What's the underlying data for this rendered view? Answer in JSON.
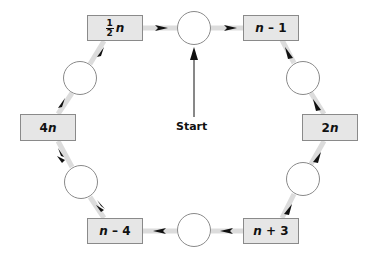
{
  "diagram": {
    "title": "",
    "start_label": "Start",
    "nodes": [
      {
        "id": "half_n",
        "type": "box",
        "label_fraction_num": "1",
        "label_fraction_den": "2",
        "label_var": "n"
      },
      {
        "id": "c_top",
        "type": "circle",
        "label": ""
      },
      {
        "id": "n_minus_1",
        "type": "box",
        "label": "n – 1"
      },
      {
        "id": "c_right_top",
        "type": "circle",
        "label": ""
      },
      {
        "id": "two_n",
        "type": "box",
        "label": "2n"
      },
      {
        "id": "c_right_bottom",
        "type": "circle",
        "label": ""
      },
      {
        "id": "n_plus_3",
        "type": "box",
        "label": "n + 3"
      },
      {
        "id": "c_bottom",
        "type": "circle",
        "label": ""
      },
      {
        "id": "n_minus_4",
        "type": "box",
        "label": "n – 4"
      },
      {
        "id": "c_left_bottom",
        "type": "circle",
        "label": ""
      },
      {
        "id": "four_n",
        "type": "box",
        "label": "4n"
      },
      {
        "id": "c_left_top",
        "type": "circle",
        "label": ""
      }
    ],
    "box_labels": {
      "n_minus_1_var": "n",
      "n_minus_1_rest": " – 1",
      "two_n_coef": "2",
      "two_n_var": "n",
      "n_plus_3_var": "n",
      "n_plus_3_rest": " + 3",
      "n_minus_4_var": "n",
      "n_minus_4_rest": " – 4",
      "four_n_coef": "4",
      "four_n_var": "n",
      "half_num": "1",
      "half_den": "2",
      "half_var": "n"
    },
    "flow": "clockwise",
    "colors": {
      "box_fill": "#e6e6e6",
      "box_border": "#8a8a8a",
      "connector": "#d9d9d9",
      "arrow": "#111111"
    }
  }
}
